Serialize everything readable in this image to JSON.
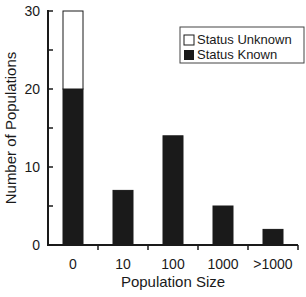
{
  "chart_data": {
    "type": "bar",
    "stacked": true,
    "title": "",
    "xlabel": "Population Size",
    "ylabel": "Number of Populations",
    "categories": [
      "0",
      "10",
      "100",
      "1000",
      ">1000"
    ],
    "series": [
      {
        "name": "Status Known",
        "color": "#1a1a1a",
        "values": [
          20,
          7,
          14,
          5,
          2
        ]
      },
      {
        "name": "Status Unknown",
        "color": "#ffffff",
        "values": [
          10,
          0,
          0,
          0,
          0
        ]
      }
    ],
    "ylim": [
      0,
      30
    ],
    "yticks": [
      "0",
      "10",
      "20",
      "30"
    ],
    "grid": false,
    "legend_position": "upper right"
  },
  "legend": {
    "items": [
      {
        "label": "Status Unknown",
        "swatch": "open-square"
      },
      {
        "label": "Status Known",
        "swatch": "filled-square"
      }
    ]
  }
}
